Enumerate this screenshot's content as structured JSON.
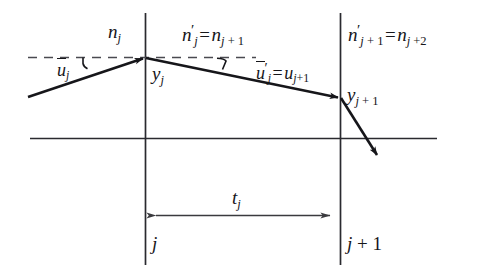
{
  "figure": {
    "kind": "optics-ray-transfer-diagram",
    "ink_color": "#16161a",
    "background_color": "#ffffff",
    "labels": {
      "index_before": {
        "base": "n",
        "sub": "j",
        "text": "n_j"
      },
      "index_middle": {
        "lhs_base": "n",
        "lhs_prime": "′",
        "lhs_sub": "j",
        "rhs_base": "n",
        "rhs_sub": "j + 1",
        "text": "n'_j = n_j+1"
      },
      "index_after": {
        "lhs_base": "n",
        "lhs_prime": "′",
        "lhs_sub": "j + 1",
        "rhs_base": "n",
        "rhs_sub": "j + 2",
        "text": "n'_j+1 = n_j+2"
      },
      "angle_in": {
        "base": "u",
        "overbar": true,
        "sub": "j",
        "text": "ū_j"
      },
      "angle_out": {
        "lhs_base": "u",
        "lhs_overbar": true,
        "lhs_prime": "′",
        "lhs_sub": "j",
        "rhs_base": "u",
        "rhs_sub": "j + 1",
        "text": "ū'_j = u_j+1"
      },
      "height_first": {
        "base": "y",
        "sub": "j",
        "text": "y_j"
      },
      "height_second": {
        "base": "y",
        "sub": "j + 1",
        "text": "y_j+1"
      },
      "thickness": {
        "base": "t",
        "sub": "j",
        "text": "t_j"
      },
      "surface_first": {
        "base": "j",
        "text": "j"
      },
      "surface_second": {
        "base": "j",
        "suffix": " + 1",
        "text": "j + 1"
      }
    },
    "geometry": {
      "surface_line_first_x": 145,
      "surface_line_second_x": 340,
      "surface_line_top_y": 13,
      "surface_line_bottom_y": 265,
      "optical_axis_y": 138,
      "optical_axis_x_start": 30,
      "optical_axis_x_end": 437,
      "dashed_reference_y": 57,
      "dashed_reference_x_start": 28,
      "dashed_reference_x_end": 256,
      "incoming_ray": {
        "x1": 28,
        "y1": 97,
        "x2": 145,
        "y2": 58
      },
      "middle_ray": {
        "x1": 145,
        "y1": 58,
        "x2": 340,
        "y2": 98
      },
      "outgoing_ray": {
        "x1": 340,
        "y1": 98,
        "x2": 379,
        "y2": 157
      },
      "dimension_arrow": {
        "x1": 147,
        "x2": 338,
        "y": 215
      }
    }
  }
}
